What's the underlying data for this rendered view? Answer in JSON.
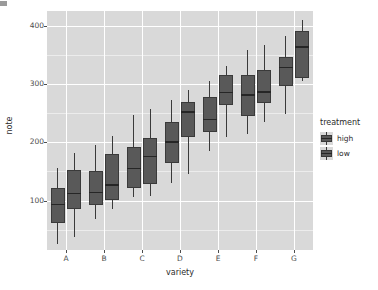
{
  "chart_data": {
    "type": "boxplot",
    "title": "",
    "subtitle": "",
    "xlabel": "variety",
    "ylabel": "note",
    "categories": [
      "A",
      "B",
      "C",
      "D",
      "E",
      "F",
      "G"
    ],
    "ylim": [
      15,
      425
    ],
    "yticks": [
      100,
      200,
      300,
      400
    ],
    "ytick_labels": [
      "100",
      "200",
      "300",
      "400"
    ],
    "grid": true,
    "legend": {
      "title": "treatment",
      "position": "right",
      "entries": [
        "high",
        "low"
      ]
    },
    "colors": {
      "panel_background": "#d9d9d9",
      "gridline_major": "#ffffff",
      "gridline_minor": "#ececec",
      "box_fill_high": "#595959",
      "box_fill_low": "#595959",
      "box_outline": "#3a3a3a",
      "median_line": "#262626",
      "text": "#2b2b2b"
    },
    "series": [
      {
        "name": "high",
        "fill": "#595959",
        "boxes": [
          {
            "category": "A",
            "min": 25,
            "q1": 62,
            "median": 93,
            "q3": 122,
            "max": 155
          },
          {
            "category": "B",
            "min": 68,
            "q1": 92,
            "median": 114,
            "q3": 150,
            "max": 196
          },
          {
            "category": "C",
            "min": 105,
            "q1": 121,
            "median": 155,
            "q3": 192,
            "max": 247
          },
          {
            "category": "D",
            "min": 130,
            "q1": 165,
            "median": 200,
            "q3": 234,
            "max": 272
          },
          {
            "category": "E",
            "min": 185,
            "q1": 218,
            "median": 239,
            "q3": 277,
            "max": 305
          },
          {
            "category": "F",
            "min": 215,
            "q1": 245,
            "median": 281,
            "q3": 316,
            "max": 359
          },
          {
            "category": "G",
            "min": 249,
            "q1": 297,
            "median": 328,
            "q3": 347,
            "max": 383
          }
        ]
      },
      {
        "name": "low",
        "fill": "#595959",
        "boxes": [
          {
            "category": "A",
            "min": 38,
            "q1": 85,
            "median": 112,
            "q3": 152,
            "max": 182
          },
          {
            "category": "B",
            "min": 85,
            "q1": 100,
            "median": 126,
            "q3": 180,
            "max": 211
          },
          {
            "category": "C",
            "min": 108,
            "q1": 128,
            "median": 175,
            "q3": 207,
            "max": 257
          },
          {
            "category": "D",
            "min": 146,
            "q1": 208,
            "median": 252,
            "q3": 268,
            "max": 289
          },
          {
            "category": "E",
            "min": 208,
            "q1": 263,
            "median": 285,
            "q3": 315,
            "max": 331
          },
          {
            "category": "F",
            "min": 235,
            "q1": 267,
            "median": 286,
            "q3": 323,
            "max": 366
          },
          {
            "category": "G",
            "min": 305,
            "q1": 310,
            "median": 363,
            "q3": 390,
            "max": 410
          }
        ]
      }
    ]
  },
  "axes": {
    "y_title": "note",
    "x_title": "variety"
  },
  "legend": {
    "title": "treatment",
    "items": [
      {
        "label": "high"
      },
      {
        "label": "low"
      }
    ]
  }
}
